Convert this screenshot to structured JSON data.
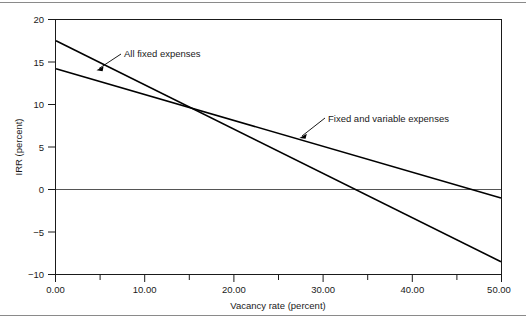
{
  "figure": {
    "rule_top": "horizontal-rule",
    "rule_bottom": "horizontal-rule"
  },
  "chart_data": {
    "type": "line",
    "title": "",
    "xlabel": "Vacancy rate (percent)",
    "ylabel": "IRR (percent)",
    "xlim": [
      0,
      50
    ],
    "ylim": [
      -10,
      20
    ],
    "grid": false,
    "legend": "none",
    "zero_line": 0,
    "x_ticks": [
      0,
      10,
      20,
      30,
      40,
      50
    ],
    "x_tick_labels": [
      "0.00",
      "10.00",
      "20.00",
      "30.00",
      "40.00",
      "50.00"
    ],
    "x_minor_ticks": [
      5,
      15,
      25,
      35,
      45
    ],
    "y_ticks": [
      -10,
      -5,
      0,
      5,
      10,
      15,
      20
    ],
    "y_tick_labels": [
      "−10",
      "−5",
      "0",
      "5",
      "10",
      "15",
      "20"
    ],
    "x": [
      0,
      50
    ],
    "series": [
      {
        "name": "All fixed expenses",
        "values": [
          17.5,
          -8.5
        ],
        "annotation": {
          "label": "All fixed expenses",
          "point_x": 6.8,
          "point_y": 13.9
        }
      },
      {
        "name": "Fixed and variable expenses",
        "values": [
          14.2,
          -1.0
        ],
        "annotation": {
          "label": "Fixed and variable expenses",
          "point_x": 27.5,
          "point_y": 5.8
        }
      }
    ],
    "intersection": {
      "x": 15.1,
      "y": 10.1
    },
    "breakeven": [
      {
        "series": "All fixed expenses",
        "x": 33.6
      },
      {
        "series": "Fixed and variable expenses",
        "x": 46.7
      }
    ],
    "annotations": [
      {
        "label": "All fixed expenses",
        "text_x": 124,
        "text_y": 57
      },
      {
        "label": "Fixed and variable expenses",
        "text_x": 328,
        "text_y": 122
      }
    ]
  }
}
